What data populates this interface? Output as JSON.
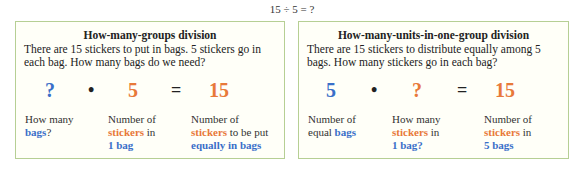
{
  "header": {
    "equation": "15 ÷ 5 = ?"
  },
  "colors": {
    "blue": "#3a6fc9",
    "orange": "#e8793a",
    "border": "#b6cf94"
  },
  "left_box": {
    "title": "How-many-groups division",
    "text": "There are 15 stickers to put in bags. 5 stickers go in each bag. How many bags do we need?",
    "equation": {
      "a": "?",
      "op": "•",
      "b": "5",
      "eq": "=",
      "c": "15"
    },
    "labels": {
      "a": {
        "l1": "How many",
        "l2_kw": "bags",
        "l2_rest": "?"
      },
      "b": {
        "l1": "Number of",
        "l2_kw": "stickers",
        "l2_rest": " in",
        "l3_kw": "1 bag"
      },
      "c": {
        "l1": "Number of",
        "l2_kw": "stickers",
        "l2_rest": " to be put",
        "l3_kw": "equally in bags"
      }
    }
  },
  "right_box": {
    "title": "How-many-units-in-one-group division",
    "text": "There are 15 stickers to distribute equally among 5 bags. How many stickers go in each bag?",
    "equation": {
      "a": "5",
      "op": "•",
      "b": "?",
      "eq": "=",
      "c": "15"
    },
    "labels": {
      "a": {
        "l1": "Number of",
        "l2_pre": "equal ",
        "l2_kw": "bags"
      },
      "b": {
        "l1": "How many",
        "l2_kw": "stickers",
        "l2_rest": " in",
        "l3_kw": "1 bag?"
      },
      "c": {
        "l1": "Number of",
        "l2_kw": "stickers",
        "l2_rest": " in",
        "l3_kw": "5 bags"
      }
    }
  }
}
